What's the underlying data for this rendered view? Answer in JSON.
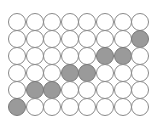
{
  "grid": {
    "rows": 6,
    "cols": 8,
    "pitch_x": 17.6,
    "pitch_y": 17.0,
    "diameter": 18,
    "colors": {
      "empty_fill": "#ffffff",
      "empty_border": "#8a8a8a",
      "filled_fill": "#9a9a9a",
      "filled_border": "#7a7a7a"
    },
    "filled": [
      [
        1,
        7
      ],
      [
        2,
        5
      ],
      [
        2,
        6
      ],
      [
        3,
        3
      ],
      [
        3,
        4
      ],
      [
        4,
        1
      ],
      [
        4,
        2
      ],
      [
        5,
        0
      ]
    ]
  }
}
